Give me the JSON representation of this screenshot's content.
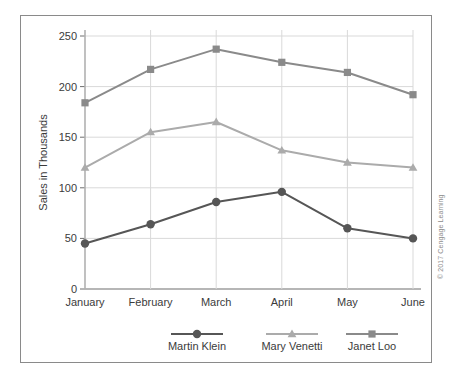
{
  "figure": {
    "copyright": "© 2017 Cengage Learning"
  },
  "chart_data": {
    "type": "line",
    "title": "",
    "xlabel": "",
    "ylabel": "Sales in Thousands",
    "categories": [
      "January",
      "February",
      "March",
      "April",
      "May",
      "June"
    ],
    "ylim": [
      0,
      250
    ],
    "yticks": [
      0,
      50,
      100,
      150,
      200,
      250
    ],
    "ytick_labels": [
      "0",
      "50",
      "100",
      "150",
      "200",
      "250"
    ],
    "grid": true,
    "legend_position": "bottom",
    "series": [
      {
        "name": "Martin Klein",
        "marker": "circle",
        "color": "#565656",
        "values": [
          45,
          64,
          86,
          96,
          60,
          50
        ]
      },
      {
        "name": "Mary Venetti",
        "marker": "triangle",
        "color": "#ababab",
        "values": [
          120,
          155,
          165,
          137,
          125,
          120
        ]
      },
      {
        "name": "Janet Loo",
        "marker": "square",
        "color": "#8a8a8a",
        "values": [
          184,
          217,
          237,
          224,
          214,
          192
        ]
      }
    ]
  }
}
